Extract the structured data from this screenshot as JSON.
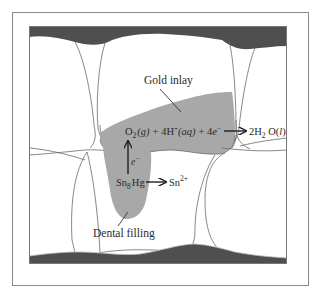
{
  "figure": {
    "colors": {
      "gum": "#4f4f4f",
      "metal": "#a8a8a8",
      "outline": "#6a6a6a",
      "frame": "#8a8a8a",
      "background": "#ffffff",
      "text": "#2a2a2a"
    },
    "labels": {
      "gold_inlay": "Gold inlay",
      "dental_filling": "Dental filling",
      "electron": "e",
      "electron_charge": "−"
    },
    "reduction": {
      "o2": "O",
      "o2_sub": "2",
      "o2_state": "(g)",
      "plus1": "+ 4H",
      "h_charge": "+",
      "h_state": "(aq)",
      "plus2": "+ 4",
      "electron": "e",
      "electron_charge": "−",
      "product_coef": "2H",
      "product_sub": "2",
      "product_o": " O(",
      "product_state": "l",
      "product_close": ")"
    },
    "oxidation": {
      "reactant": "Sn",
      "reactant_sub": "8",
      "reactant_hg": "Hg",
      "product": "Sn",
      "product_charge": "2+"
    }
  }
}
